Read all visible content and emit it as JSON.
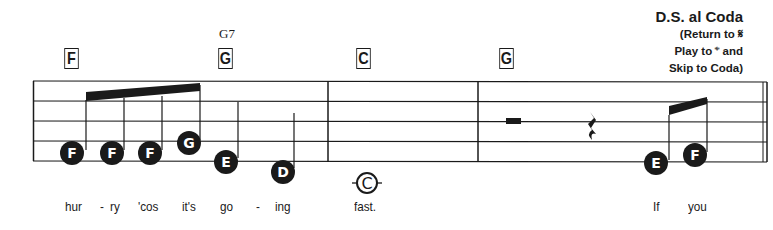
{
  "chords": [
    {
      "label": "F",
      "x": 63,
      "y": 48
    },
    {
      "label": "G",
      "x": 217,
      "y": 48
    },
    {
      "label": "C",
      "x": 355,
      "y": 48
    },
    {
      "label": "G",
      "x": 498,
      "y": 48
    }
  ],
  "chord_names": [
    {
      "label": "G7",
      "x": 219,
      "y": 26
    }
  ],
  "direction": {
    "title": "D.S. al Coda",
    "lines": [
      "(Return to 𝄋",
      "Play to 𝄌 and",
      "Skip to Coda)"
    ]
  },
  "notes": [
    {
      "letter": "F",
      "cx": 72,
      "cy": 153
    },
    {
      "letter": "F",
      "cx": 112,
      "cy": 153
    },
    {
      "letter": "F",
      "cx": 150,
      "cy": 153
    },
    {
      "letter": "G",
      "cx": 189,
      "cy": 143
    },
    {
      "letter": "E",
      "cx": 226,
      "cy": 162
    },
    {
      "letter": "D",
      "cx": 283,
      "cy": 172
    },
    {
      "letter": "E",
      "cx": 656,
      "cy": 163
    },
    {
      "letter": "F",
      "cx": 695,
      "cy": 155
    }
  ],
  "coda_note": {
    "letter": "C",
    "cx": 367,
    "cy": 183
  },
  "lyrics": [
    {
      "text": "hur",
      "x": 65
    },
    {
      "text": "-",
      "x": 100
    },
    {
      "text": "ry",
      "x": 110
    },
    {
      "text": "'cos",
      "x": 138
    },
    {
      "text": "it's",
      "x": 182
    },
    {
      "text": "go",
      "x": 220
    },
    {
      "text": "-",
      "x": 256
    },
    {
      "text": "ing",
      "x": 275
    },
    {
      "text": "fast.",
      "x": 354
    },
    {
      "text": "If",
      "x": 653
    },
    {
      "text": "you",
      "x": 688
    }
  ],
  "colors": {
    "ink": "#1a1a1a",
    "background": "#ffffff"
  }
}
